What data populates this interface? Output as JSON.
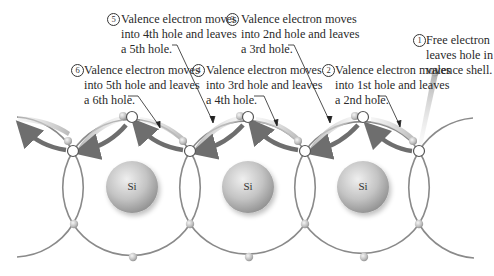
{
  "diagram": {
    "atoms": [
      {
        "label": "Si",
        "x": 132,
        "y": 187
      },
      {
        "label": "Si",
        "x": 248,
        "y": 187
      },
      {
        "label": "Si",
        "x": 363,
        "y": 187
      }
    ],
    "steps": [
      {
        "number": "1",
        "lines": [
          "Free electron",
          "leaves hole in",
          "valence shell."
        ]
      },
      {
        "number": "2",
        "lines": [
          "Valence electron moves",
          "into 1st hole and leaves",
          "a 2nd hole."
        ]
      },
      {
        "number": "3",
        "lines": [
          "Valence electron moves",
          "into 2nd hole and leaves",
          "a 3rd hole."
        ]
      },
      {
        "number": "4",
        "lines": [
          "Valence electron moves",
          "into 3rd hole and leaves",
          "a 4th hole."
        ]
      },
      {
        "number": "5",
        "lines": [
          "Valence electron moves",
          "into 4th hole and leaves",
          "a 5th hole."
        ]
      },
      {
        "number": "6",
        "lines": [
          "Valence electron moves",
          "into 5th hole and leaves",
          "a 6th hole."
        ]
      }
    ],
    "colors": {
      "orbit": "#8a8a8a",
      "arrow": "#6e6e6e",
      "tail": "#c8c8c8",
      "atom": "#b5b5b5",
      "text": "#2a2a2a"
    }
  }
}
